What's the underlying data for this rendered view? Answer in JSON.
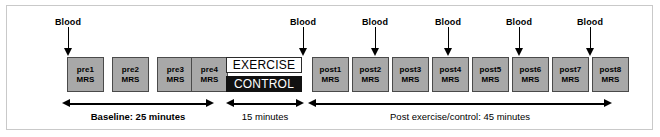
{
  "figure": {
    "background_color": "#ffffff",
    "frame_border_color": "#c9c9c9",
    "box_fill_color": "#a8a8a8",
    "box_border_color": "#4a4a4a",
    "exercise_fill_color": "#ffffff",
    "control_fill_color": "#111111",
    "arrow_color": "#000000"
  },
  "blood_markers": [
    {
      "label": "Blood",
      "x": 68
    },
    {
      "label": "Blood",
      "x": 303
    },
    {
      "label": "Blood",
      "x": 375
    },
    {
      "label": "Blood",
      "x": 448
    },
    {
      "label": "Blood",
      "x": 519
    },
    {
      "label": "Blood",
      "x": 590
    }
  ],
  "mrs_boxes": [
    {
      "line1": "pre1",
      "line2": "MRS",
      "x": 67
    },
    {
      "line1": "pre2",
      "line2": "MRS",
      "x": 112
    },
    {
      "line1": "pre3",
      "line2": "MRS",
      "x": 157
    },
    {
      "line1": "pre4",
      "line2": "MRS",
      "x": 191
    },
    {
      "line1": "post1",
      "line2": "MRS",
      "x": 312
    },
    {
      "line1": "post2",
      "line2": "MRS",
      "x": 352
    },
    {
      "line1": "post3",
      "line2": "MRS",
      "x": 392
    },
    {
      "line1": "post4",
      "line2": "MRS",
      "x": 432
    },
    {
      "line1": "post5",
      "line2": "MRS",
      "x": 472
    },
    {
      "line1": "post6",
      "line2": "MRS",
      "x": 512
    },
    {
      "line1": "post7",
      "line2": "MRS",
      "x": 552
    },
    {
      "line1": "post8",
      "line2": "MRS",
      "x": 592
    }
  ],
  "conditions": {
    "exercise_label": "EXERCISE",
    "control_label": "CONTROL"
  },
  "phases": [
    {
      "label": "Baseline: 25 minutes",
      "bold": true,
      "start": 62,
      "end": 214,
      "label_x": 138
    },
    {
      "label": "15 minutes",
      "bold": false,
      "start": 226,
      "end": 304,
      "label_x": 265
    },
    {
      "label": "Post exercise/control: 45 minutes",
      "bold": false,
      "start": 308,
      "end": 612,
      "label_x": 460
    }
  ]
}
